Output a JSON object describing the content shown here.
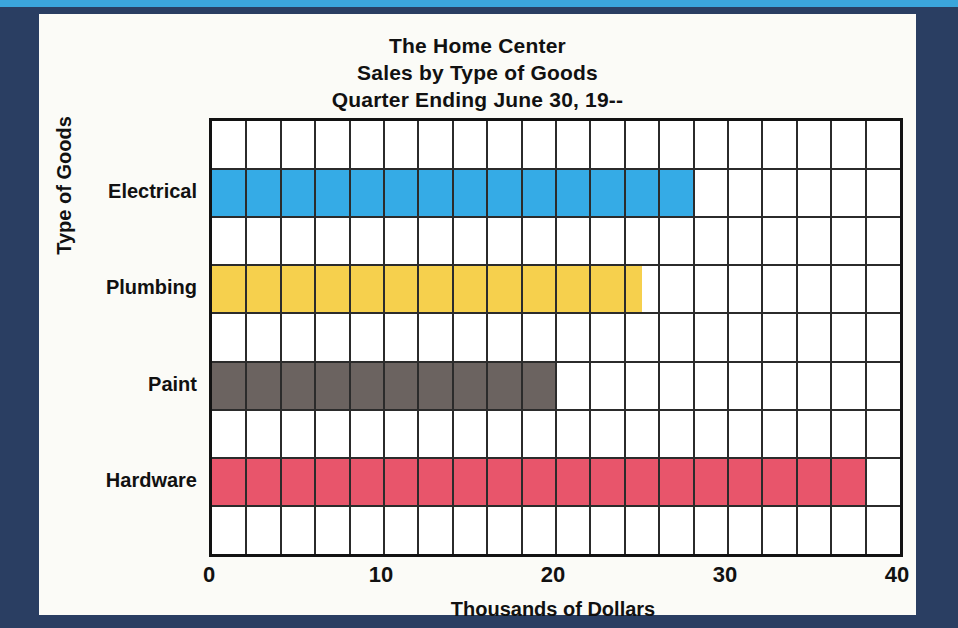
{
  "poster": {
    "frame_color": "#2a3e62",
    "accent_strip_color": "#3ba5dc",
    "card_color": "#fbfbf7"
  },
  "title": {
    "line1": "The Home Center",
    "line2": "Sales by Type of Goods",
    "line3": "Quarter Ending June 30, 19--"
  },
  "chart_data": {
    "type": "bar",
    "orientation": "horizontal",
    "title": "The Home Center Sales by Type of Goods Quarter Ending June 30, 19--",
    "subtitle": "Quarter Ending June 30, 19--",
    "categories": [
      "Electrical",
      "Plumbing",
      "Paint",
      "Hardware"
    ],
    "values": [
      28,
      25,
      20,
      38
    ],
    "series": [
      {
        "name": "Sales",
        "values": [
          28,
          25,
          20,
          38
        ]
      }
    ],
    "bar_colors": [
      "#35abe6",
      "#f6d04d",
      "#6b6360",
      "#e8556b"
    ],
    "xlabel": "Thousands of Dollars",
    "ylabel": "Type of Goods",
    "xlim": [
      0,
      40
    ],
    "xticks": [
      0,
      10,
      20,
      30,
      40
    ],
    "xtick_labels": [
      "0",
      "10",
      "20",
      "30",
      "40"
    ],
    "grid": true,
    "grid_x_step": 2,
    "grid_rows": 9,
    "legend": "none"
  }
}
